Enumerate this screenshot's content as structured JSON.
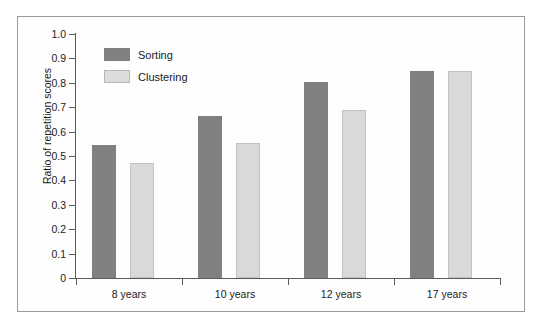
{
  "chart_data": {
    "type": "bar",
    "title": "",
    "xlabel": "",
    "ylabel": "Ratio of repetition scores",
    "ylim": [
      0,
      1.0
    ],
    "grid": false,
    "legend_position": "top-left inside plot",
    "categories": [
      "8 years",
      "10 years",
      "12 years",
      "17 years"
    ],
    "series": [
      {
        "name": "Sorting",
        "color": "#808080",
        "values": [
          0.545,
          0.665,
          0.805,
          0.85
        ]
      },
      {
        "name": "Clustering",
        "color": "#d9d9d9",
        "values": [
          0.47,
          0.555,
          0.69,
          0.85
        ]
      }
    ],
    "ytick_labels": [
      "1.0",
      "0.9",
      "0.8",
      "0.7",
      "0.6",
      "0.5",
      "0.4",
      "0.3",
      "0.2",
      "0.1",
      "0"
    ],
    "ytick_values": [
      1.0,
      0.9,
      0.8,
      0.7,
      0.6,
      0.5,
      0.4,
      0.3,
      0.2,
      0.1,
      0
    ]
  },
  "figure": {
    "background_color": "#ffffff",
    "frame_color": "#9a9a9a",
    "axis_color": "#5a5a5a"
  }
}
